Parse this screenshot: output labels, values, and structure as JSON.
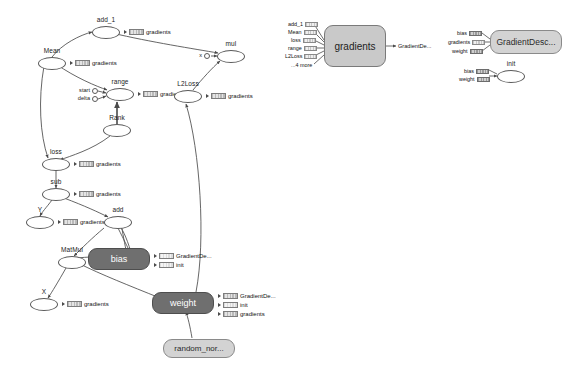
{
  "graph": {
    "title": "tensorflow-graph",
    "main_nodes": [
      {
        "id": "add_1",
        "label": "add_1",
        "type": "op"
      },
      {
        "id": "Mean",
        "label": "Mean",
        "type": "op"
      },
      {
        "id": "mul",
        "label": "mul",
        "type": "op"
      },
      {
        "id": "range",
        "label": "range",
        "type": "op"
      },
      {
        "id": "Rank",
        "label": "Rank",
        "type": "op"
      },
      {
        "id": "L2Loss",
        "label": "L2Loss",
        "type": "op"
      },
      {
        "id": "loss",
        "label": "loss",
        "type": "op"
      },
      {
        "id": "sub",
        "label": "sub",
        "type": "op"
      },
      {
        "id": "Y",
        "label": "Y",
        "type": "op"
      },
      {
        "id": "add",
        "label": "add",
        "type": "op"
      },
      {
        "id": "MatMul",
        "label": "MatMul",
        "type": "op"
      },
      {
        "id": "X",
        "label": "X",
        "type": "op"
      }
    ],
    "ports": [
      {
        "id": "start",
        "label": "start"
      },
      {
        "id": "delta",
        "label": "delta"
      },
      {
        "id": "x",
        "label": "x"
      }
    ],
    "boxes": [
      {
        "id": "bias",
        "label": "bias",
        "style": "dark"
      },
      {
        "id": "weight",
        "label": "weight",
        "style": "dark"
      },
      {
        "id": "random_normal",
        "label": "random_nor...",
        "style": "light"
      }
    ],
    "annotations": {
      "gradients": "gradients",
      "gradient_descent": "GradientDe...",
      "init": "init"
    },
    "node_annotations": [
      {
        "node": "add_1",
        "labels": [
          "gradients"
        ]
      },
      {
        "node": "Mean",
        "labels": [
          "gradients"
        ]
      },
      {
        "node": "range",
        "labels": [
          "gradients"
        ]
      },
      {
        "node": "L2Loss",
        "labels": [
          "gradients"
        ]
      },
      {
        "node": "loss",
        "labels": [
          "gradients"
        ]
      },
      {
        "node": "sub",
        "labels": [
          "gradients"
        ]
      },
      {
        "node": "Y",
        "labels": [
          "gradients"
        ]
      },
      {
        "node": "X",
        "labels": [
          "gradients"
        ]
      },
      {
        "node": "bias",
        "labels": [
          "GradientDe...",
          "init"
        ]
      },
      {
        "node": "weight",
        "labels": [
          "GradientDe...",
          "init",
          "gradients"
        ]
      }
    ]
  },
  "gradients_panel": {
    "title": "gradients",
    "inputs": [
      "add_1",
      "Mean",
      "loss",
      "range",
      "L2Loss",
      "...4 more"
    ],
    "output": "GradientDe..."
  },
  "optimizer_panel": {
    "title": "GradientDesc...",
    "inputs": [
      "bias",
      "gradients",
      "weight"
    ],
    "init": {
      "title": "init",
      "inputs": [
        "bias",
        "weight"
      ]
    }
  },
  "colors": {
    "node_fill": "#ffffff",
    "node_stroke": "#5a5a5a",
    "box_dark": "#6f6f6f",
    "box_light": "#d3d3d3",
    "edge": "#4a4a4a",
    "text": "#111111"
  }
}
